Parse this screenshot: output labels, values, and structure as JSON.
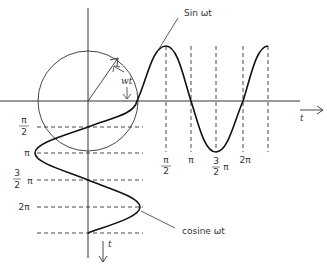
{
  "diagram": {
    "labels": {
      "sine": "Sin ωt",
      "cosine": "cosine ωt",
      "angle": "wt",
      "t_horizontal": "t",
      "t_vertical": "t"
    },
    "x_ticks": [
      {
        "num": "π",
        "den": "2",
        "suffix": ""
      },
      {
        "num": "",
        "den": "",
        "suffix": "π"
      },
      {
        "num": "3",
        "den": "2",
        "suffix": "π"
      },
      {
        "num": "",
        "den": "",
        "suffix": "2π"
      }
    ],
    "y_ticks": [
      {
        "num": "π",
        "den": "2",
        "suffix": ""
      },
      {
        "num": "",
        "den": "",
        "suffix": "π"
      },
      {
        "num": "3",
        "den": "2",
        "suffix": "π"
      },
      {
        "num": "",
        "den": "",
        "suffix": "2π"
      }
    ]
  }
}
